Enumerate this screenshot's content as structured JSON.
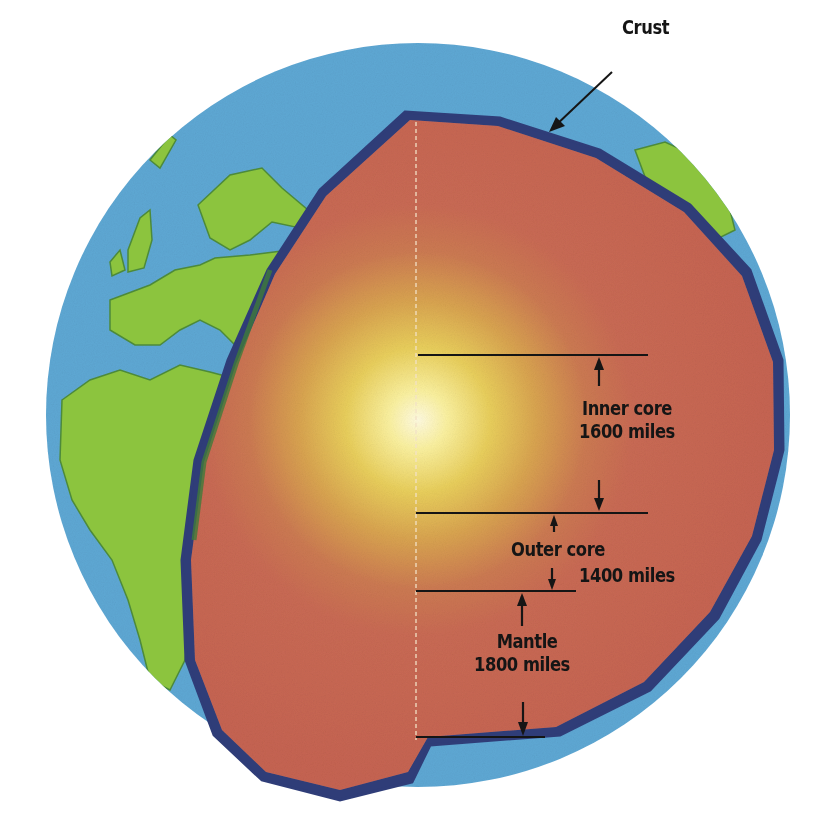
{
  "figure": {
    "type": "cutaway diagram of Earth's interior",
    "caption_fragment_bottom": "1-1 How much ... inside the Earth?"
  },
  "labels": {
    "crust": "Crust",
    "inner_core": {
      "name": "Inner core",
      "thickness": "1600 miles"
    },
    "outer_core": {
      "name": "Outer core",
      "thickness": "1400 miles"
    },
    "mantle": {
      "name": "Mantle",
      "thickness": "1800 miles"
    }
  },
  "colors": {
    "ocean": "#5aa6d2",
    "land": "#8cc43c",
    "crust_outline": "#2f3f7a",
    "mantle": "#cc6a52",
    "outer_core": "#d89a4a",
    "inner_core_glow": "#fff6c8",
    "measure_lines": "#151515"
  }
}
